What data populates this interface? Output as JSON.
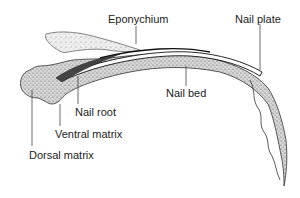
{
  "diagram": {
    "type": "anatomical-illustration",
    "labels": [
      {
        "id": "eponychium",
        "text": "Eponychium"
      },
      {
        "id": "nail-plate",
        "text": "Nail plate"
      },
      {
        "id": "nail-bed",
        "text": "Nail bed"
      },
      {
        "id": "nail-root",
        "text": "Nail root"
      },
      {
        "id": "ventral-matrix",
        "text": "Ventral matrix"
      },
      {
        "id": "dorsal-matrix",
        "text": "Dorsal matrix"
      }
    ]
  },
  "colors": {
    "ink": "#222222",
    "tissue_fill": "#cfcfcf",
    "background": "#ffffff"
  }
}
